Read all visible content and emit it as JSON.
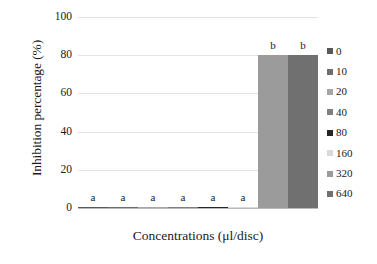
{
  "chart_data": {
    "type": "bar",
    "title": "",
    "xlabel": "Concentrations (μl/disc)",
    "ylabel": "Inhibition percentage (%)",
    "categories": [
      "0",
      "10",
      "20",
      "40",
      "80",
      "160",
      "320",
      "640"
    ],
    "values": [
      0,
      0,
      0,
      0,
      0,
      0,
      80,
      80
    ],
    "annotations": [
      "a",
      "a",
      "a",
      "a",
      "a",
      "a",
      "b",
      "b"
    ],
    "colors": [
      "#595959",
      "#6e6e6e",
      "#a6a6a6",
      "#7f7f7f",
      "#262626",
      "#d9d9d9",
      "#9b9b9b",
      "#707070"
    ],
    "ylim": [
      0,
      100
    ],
    "yticks": [
      0,
      20,
      40,
      60,
      80,
      100
    ],
    "ytick_labels": [
      "0",
      "20",
      "40",
      "60",
      "80",
      "100"
    ],
    "xtick_labels": [],
    "grid": true,
    "legend_position": "right",
    "legend_entries": [
      "0",
      "10",
      "20",
      "40",
      "80",
      "160",
      "320",
      "640"
    ]
  }
}
